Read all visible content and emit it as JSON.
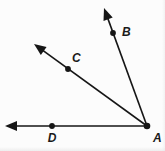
{
  "figure": {
    "background_color": "#fcfcfc",
    "stroke_color": "#161616",
    "label_color": "#1a1a1a",
    "vertex": {
      "name": "A",
      "label": "A",
      "x": 147,
      "y": 126,
      "label_x": 153,
      "label_y": 142
    },
    "rays": [
      {
        "name": "ray-AB",
        "label": "B",
        "from_x": 147,
        "from_y": 126,
        "to_x": 104,
        "to_y": 8,
        "point_x": 113,
        "point_y": 33,
        "label_x": 122,
        "label_y": 36
      },
      {
        "name": "ray-AC",
        "label": "C",
        "from_x": 147,
        "from_y": 126,
        "to_x": 34,
        "to_y": 44,
        "point_x": 68,
        "point_y": 69,
        "label_x": 72,
        "label_y": 62
      },
      {
        "name": "ray-AD",
        "label": "D",
        "from_x": 147,
        "from_y": 126,
        "to_x": 5,
        "to_y": 126,
        "point_x": 52,
        "point_y": 126,
        "label_x": 52,
        "label_y": 142
      }
    ]
  }
}
